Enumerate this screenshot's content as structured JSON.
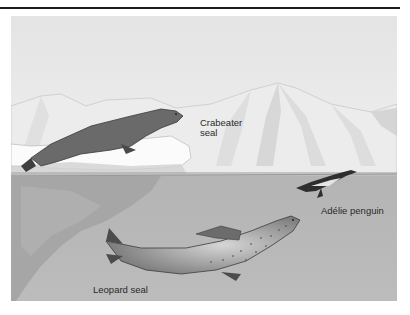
{
  "figure": {
    "labels": {
      "crabeater_seal": "Crabeater\nseal",
      "adelie_penguin": "Adélie penguin",
      "leopard_seal": "Leopard seal"
    },
    "colors": {
      "sky": "#e8e8e8",
      "mountains": "#f2f2f2",
      "mountain_shade": "#c8c8c8",
      "water": "#b9b9b9",
      "ice_underwater": "#a9a9a9",
      "seal_dark": "#5c5c5c",
      "text": "#2a2a2a",
      "top_rule": "#1c1c1c"
    }
  }
}
